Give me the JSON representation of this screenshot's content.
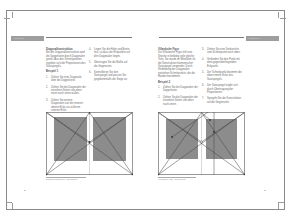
{
  "spread": {
    "type": "book-spread",
    "language": "de"
  },
  "left_page": {
    "header": {
      "tab_label": "Satzspiegel"
    },
    "column_1": {
      "heading": "Diagonalkonstruktion",
      "intro": "Bei der Diagonalkonstruktion wird die Doppelseite durch Diagonalen geteilt. Aus den Schnittpunkten ergeben sich die Proportionen des Satzspiegels.",
      "example_heading": "Beispiel 1",
      "steps": [
        {
          "num": "1.",
          "text": "Ziehen Sie eine Diagonale über die Doppelseite."
        },
        {
          "num": "2.",
          "text": "Ziehen Sie die Diagonalen der einzelnen Seiten von oben innen nach unten außen."
        },
        {
          "num": "3.",
          "text": "Ziehen Sie weitere Diagonalen von der inneren oberen Ecke zur äußeren unteren Ecke."
        }
      ]
    },
    "column_2": {
      "steps": [
        {
          "num": "4.",
          "text": "Legen Sie die Höhe und Breite fest, so dass die Eckpunkte auf den Diagonalen liegen."
        },
        {
          "num": "5.",
          "text": "Übertragen Sie die Maße auf die Gegenseite."
        },
        {
          "num": "6.",
          "text": "Kontrollieren Sie den Satzspiegel und passen Sie gegebenenfalls die Stege an."
        }
      ]
    },
    "figure": {
      "caption": "Diagonalkonstruktion – Doppelseite",
      "colors": {
        "text_block": "#8c8c8c",
        "lines": "#555555"
      }
    },
    "page_number": "2"
  },
  "right_page": {
    "header": {
      "tab_label": "Satzspiegel"
    },
    "column_1": {
      "heading": "Villardsche Figur",
      "intro": "Die Villardsche Figur teilt eine Strecke in beliebig viele gleiche Teile. Sie wurde im Mittelalter für die Konstruktion harmonischer Satzspiegel verwendet. Durch Verbindung der Diagonalen entstehen Schnittpunkte, die die Ränder bestimmen.",
      "example_heading": "Beispiel 2",
      "steps": [
        {
          "num": "1.",
          "text": "Ziehen Sie die Diagonalen der Doppelseite."
        },
        {
          "num": "2.",
          "text": "Ziehen Sie die Diagonalen der einzelnen Seiten von oben nach unten."
        }
      ]
    },
    "column_2": {
      "steps": [
        {
          "num": "3.",
          "text": "Ziehen Sie eine Senkrechte vom Schnittpunkt nach oben."
        },
        {
          "num": "4.",
          "text": "Verbinden Sie den Punkt mit dem gegenüberliegenden Eckpunkt."
        },
        {
          "num": "5.",
          "text": "Der Schnittpunkt bestimmt die obere innere Ecke des Satzspiegels."
        },
        {
          "num": "6.",
          "text": "Der Satzspiegel ergibt sich durch Übertragung der Proportionen."
        },
        {
          "num": "7.",
          "text": "Spiegeln Sie die Konstruktion auf die Gegenseite."
        }
      ]
    },
    "figure": {
      "caption": "Villardsche Figur – Doppelseite",
      "colors": {
        "text_block": "#8c8c8c",
        "lines": "#555555"
      }
    },
    "page_number": "3"
  }
}
